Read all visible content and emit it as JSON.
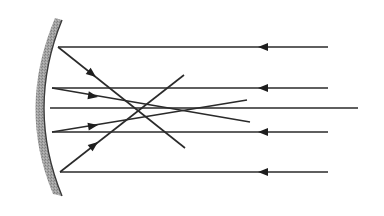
{
  "diagram": {
    "background": "#ffffff",
    "line_color": "#2a2a2a",
    "mirror": {
      "type": "concave-mirror",
      "fill_color": "#9a9a9a",
      "edge_color": "#3a3a3a",
      "top": [
        62,
        20
      ],
      "bottom": [
        62,
        196
      ],
      "vertex_x": 44,
      "thickness": 9
    },
    "incident_rays": [
      {
        "id": "incident-1",
        "y": 47,
        "x_start": 58,
        "x_end": 328,
        "arrow_x": 263,
        "direction": "left"
      },
      {
        "id": "incident-2",
        "y": 88,
        "x_start": 52,
        "x_end": 328,
        "arrow_x": 263,
        "direction": "left"
      },
      {
        "id": "optical-axis",
        "y": 108,
        "x_start": 50,
        "x_end": 358,
        "arrow_x": null,
        "direction": "none"
      },
      {
        "id": "incident-3",
        "y": 132,
        "x_start": 52,
        "x_end": 328,
        "arrow_x": 263,
        "direction": "left"
      },
      {
        "id": "incident-4",
        "y": 172,
        "x_start": 60,
        "x_end": 328,
        "arrow_x": 263,
        "direction": "left"
      }
    ],
    "reflected_rays": [
      {
        "id": "reflected-1",
        "from": [
          58,
          47
        ],
        "to": [
          185,
          148
        ],
        "arrow_at": [
          96,
          77
        ]
      },
      {
        "id": "reflected-2",
        "from": [
          52,
          88
        ],
        "to": [
          250,
          122
        ],
        "arrow_at": [
          98,
          97
        ]
      },
      {
        "id": "reflected-3",
        "from": [
          52,
          132
        ],
        "to": [
          247,
          100
        ],
        "arrow_at": [
          98,
          125
        ]
      },
      {
        "id": "reflected-4",
        "from": [
          60,
          172
        ],
        "to": [
          184,
          75
        ],
        "arrow_at": [
          98,
          142
        ]
      }
    ]
  }
}
